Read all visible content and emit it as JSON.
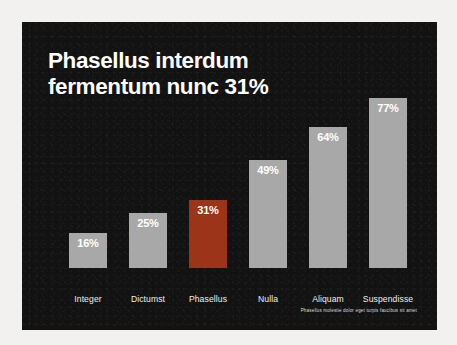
{
  "slide": {
    "title": "Phasellus interdum\nfermentum nunc 31%",
    "footnote": "Phasellus molestie dolor eget turpis faucibus sit amet",
    "background_color": "#121212",
    "frame_color": "#f2f1ef",
    "title_color": "#ffffff"
  },
  "chart_data": {
    "type": "bar",
    "title": "Phasellus interdum fermentum nunc 31%",
    "xlabel": "",
    "ylabel": "",
    "ylim": [
      0,
      100
    ],
    "grid": false,
    "legend": "none",
    "value_suffix": "%",
    "categories": [
      "Integer",
      "Dictumst",
      "Phasellus",
      "Nulla",
      "Aliquam",
      "Suspendisse"
    ],
    "values": [
      16,
      25,
      31,
      49,
      64,
      77
    ],
    "value_labels": [
      "16%",
      "25%",
      "31%",
      "49%",
      "64%",
      "77%"
    ],
    "highlight_index": 2,
    "bar_color": "#a8a8a8",
    "highlight_color": "#9b3418",
    "label_color": "#eeeeee",
    "value_label_color": "#ffffff"
  }
}
